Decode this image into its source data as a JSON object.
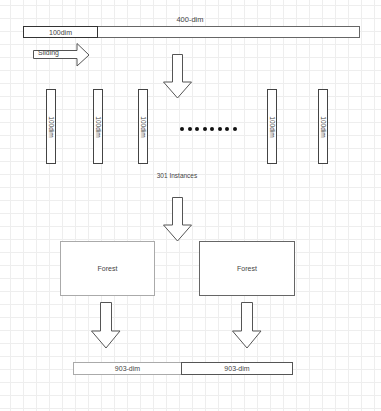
{
  "diagram": {
    "title_label": "400-dim",
    "window_label": "100dim",
    "sliding_label": "Sliding",
    "instances": [
      {
        "label": "100dim"
      },
      {
        "label": "100dim"
      },
      {
        "label": "100dim"
      },
      {
        "label": "100dim"
      },
      {
        "label": "100dim"
      }
    ],
    "ellipsis_dot_count": 8,
    "instances_caption": "301 Instances",
    "forests": [
      {
        "label": "Forest"
      },
      {
        "label": "Forest"
      }
    ],
    "outputs": [
      {
        "label": "903-dim"
      },
      {
        "label": "903-dim"
      }
    ]
  },
  "colors": {
    "grid": "#eeeeee",
    "stroke": "#555555",
    "stroke_light": "#999999",
    "dot": "#111111"
  }
}
